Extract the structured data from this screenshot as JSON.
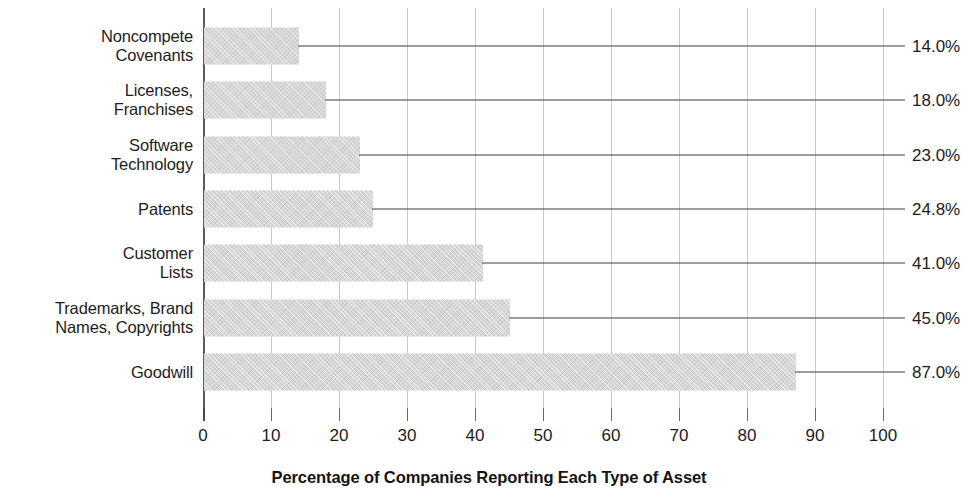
{
  "chart_data": {
    "type": "bar",
    "orientation": "horizontal",
    "title": "",
    "xlabel": "Percentage of Companies Reporting Each Type of Asset",
    "ylabel": "",
    "xlim": [
      0,
      100
    ],
    "xticks": [
      "0",
      "10",
      "20",
      "30",
      "40",
      "50",
      "60",
      "70",
      "80",
      "90",
      "100"
    ],
    "grid": "vertical",
    "legend": "none",
    "categories": [
      "Noncompete\nCovenants",
      "Licenses,\nFranchises",
      "Software\nTechnology",
      "Patents",
      "Customer\nLists",
      "Trademarks, Brand\nNames, Copyrights",
      "Goodwill"
    ],
    "values": [
      14.0,
      18.0,
      23.0,
      24.8,
      41.0,
      45.0,
      87.0
    ],
    "value_labels": [
      "14.0%",
      "18.0%",
      "23.0%",
      "24.8%",
      "41.0%",
      "45.0%",
      "87.0%"
    ],
    "bar_color": "#d6d6d6",
    "gridline_color": "#c9c9c9",
    "axis_color": "#5b5b5b",
    "leader_line_color": "#3a3a3a",
    "text_color": "#1d1d1d"
  }
}
